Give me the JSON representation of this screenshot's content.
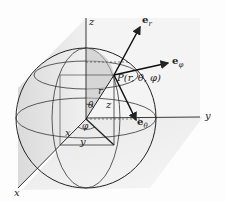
{
  "figure": {
    "type": "spherical-coordinates-diagram",
    "axes": {
      "x": "x",
      "y": "y",
      "z": "z"
    },
    "point_label": "P(r, θ, φ)",
    "segment_labels": {
      "r": "r",
      "z": "z",
      "x": "x",
      "y": "y"
    },
    "angle_labels": {
      "theta": "θ",
      "phi": "φ"
    },
    "unit_vectors": {
      "e_r": {
        "base": "e",
        "sub": "r"
      },
      "e_phi": {
        "base": "e",
        "sub": "φ"
      },
      "e_theta": {
        "base": "e",
        "sub": "θ"
      }
    },
    "colors": {
      "line": "#222222",
      "plane_shade": "#d9d9d9",
      "sphere_shade": "#cfcfcf",
      "background": "#fdfdfd"
    }
  }
}
